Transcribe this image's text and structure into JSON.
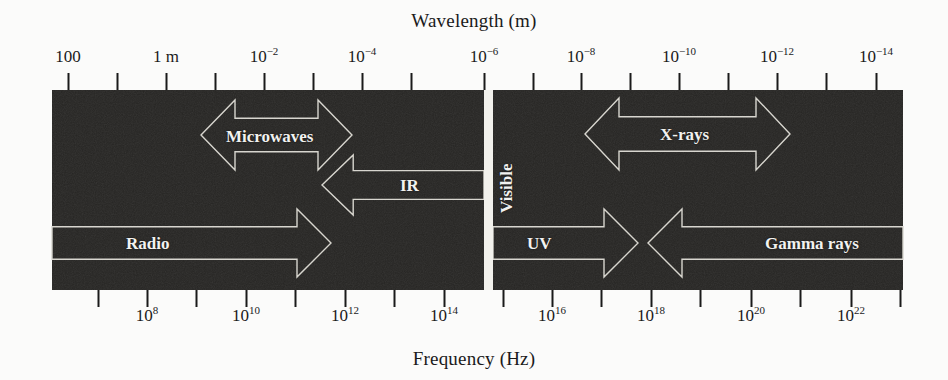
{
  "figure": {
    "band_color": "#262523",
    "band_text_color": "#f2f2f0",
    "arrow_stroke_color": "#d8d6cf",
    "axis_color": "#1a1a1a",
    "background_color": "#fbfbfa",
    "visible_gap_color": "#f2f1ec"
  },
  "top_axis": {
    "title": "Wavelength (m)",
    "labels": [
      {
        "text": "100",
        "sup": "",
        "x": 68
      },
      {
        "text": "1 m",
        "sup": "",
        "x": 166
      },
      {
        "text": "10",
        "sup": "−2",
        "x": 264
      },
      {
        "text": "10",
        "sup": "−4",
        "x": 362
      },
      {
        "text": "10",
        "sup": "−6",
        "x": 484
      },
      {
        "text": "10",
        "sup": "−8",
        "x": 581
      },
      {
        "text": "10",
        "sup": "−10",
        "x": 679
      },
      {
        "text": "10",
        "sup": "−12",
        "x": 777
      },
      {
        "text": "10",
        "sup": "−14",
        "x": 876
      }
    ],
    "ticks": [
      68,
      117,
      166,
      215,
      264,
      313,
      362,
      411,
      484,
      533,
      581,
      630,
      679,
      728,
      777,
      826,
      876
    ],
    "tick_top": 73,
    "tick_bottom": 90
  },
  "bottom_axis": {
    "title": "Frequency (Hz)",
    "labels": [
      {
        "text": "10",
        "sup": "8",
        "x": 147
      },
      {
        "text": "10",
        "sup": "10",
        "x": 246
      },
      {
        "text": "10",
        "sup": "12",
        "x": 345
      },
      {
        "text": "10",
        "sup": "14",
        "x": 444
      },
      {
        "text": "10",
        "sup": "16",
        "x": 552
      },
      {
        "text": "10",
        "sup": "18",
        "x": 651
      },
      {
        "text": "10",
        "sup": "20",
        "x": 751
      },
      {
        "text": "10",
        "sup": "22",
        "x": 851
      }
    ],
    "ticks": [
      98,
      147,
      196,
      246,
      295,
      345,
      394,
      444,
      503,
      552,
      601,
      651,
      700,
      751,
      800,
      851,
      900
    ],
    "tick_top": 290,
    "tick_bottom": 307
  },
  "band": {
    "x": 52,
    "y": 90,
    "width": 851,
    "height": 200,
    "visible_gap": {
      "x": 484,
      "width": 9
    }
  },
  "regions": [
    {
      "name": "microwaves",
      "label": "Microwaves",
      "arrow_type": "double",
      "x1": 201,
      "x2": 352,
      "top": 100,
      "bottom": 170,
      "label_x": 226,
      "label_y": 128
    },
    {
      "name": "infrared",
      "label": "IR",
      "arrow_type": "left",
      "x1": 322,
      "x2": 484,
      "top": 155,
      "bottom": 215,
      "label_x": 400,
      "label_y": 177
    },
    {
      "name": "visible",
      "label": "Visible",
      "arrow_type": "none",
      "x1": 484,
      "x2": 493,
      "top": 90,
      "bottom": 290,
      "label_x": 498,
      "label_y": 213,
      "orientation": "vertical"
    },
    {
      "name": "radio",
      "label": "Radio",
      "arrow_type": "right",
      "x1": 52,
      "x2": 331,
      "top": 209,
      "bottom": 277,
      "label_x": 126,
      "label_y": 235
    },
    {
      "name": "ultraviolet",
      "label": "UV",
      "arrow_type": "right",
      "x1": 493,
      "x2": 638,
      "top": 209,
      "bottom": 277,
      "label_x": 527,
      "label_y": 235
    },
    {
      "name": "xrays",
      "label": "X-rays",
      "arrow_type": "double",
      "x1": 585,
      "x2": 790,
      "top": 98,
      "bottom": 170,
      "label_x": 660,
      "label_y": 126
    },
    {
      "name": "gamma-rays",
      "label": "Gamma rays",
      "arrow_type": "left",
      "x1": 648,
      "x2": 903,
      "top": 209,
      "bottom": 277,
      "label_x": 765,
      "label_y": 235
    }
  ]
}
